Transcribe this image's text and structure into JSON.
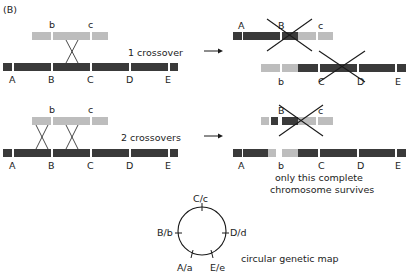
{
  "figure": {
    "panel_label": "(B)",
    "colors": {
      "dark": "#3a3a3a",
      "light": "#bdbdbd",
      "line": "#1a1a1a",
      "text": "#222222"
    },
    "row1": {
      "caption": "1 crossover",
      "top_labels": [
        "b",
        "c"
      ],
      "bottom_labels": [
        "A",
        "B",
        "C",
        "D",
        "E"
      ],
      "result_top_labels": [
        "A",
        "B",
        "c"
      ],
      "result_bottom_labels": [
        "b",
        "C",
        "D",
        "E"
      ]
    },
    "row2": {
      "caption": "2 crossovers",
      "top_labels": [
        "b",
        "c"
      ],
      "bottom_labels": [
        "A",
        "B",
        "C",
        "D",
        "E"
      ],
      "result_top_labels": [
        "B",
        "c"
      ],
      "result_bottom_labels": [
        "A",
        "b",
        "C",
        "D",
        "E"
      ],
      "note_line1": "only this complete",
      "note_line2": "chromosome survives"
    },
    "map": {
      "labels": [
        "C/c",
        "B/b",
        "D/d",
        "A/a",
        "E/e"
      ],
      "caption": "circular genetic map"
    }
  }
}
